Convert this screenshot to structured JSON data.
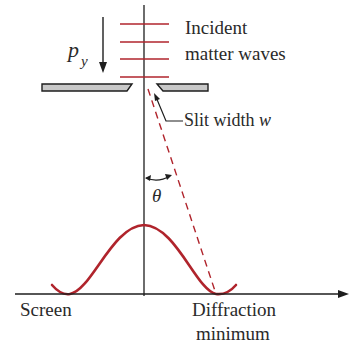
{
  "labels": {
    "momentum": "p",
    "momentum_sub": "y",
    "incident_line1": "Incident",
    "incident_line2": "matter waves",
    "slit_prefix": "Slit width ",
    "slit_var": "w",
    "angle": "θ",
    "screen": "Screen",
    "diffraction_line1": "Diffraction",
    "diffraction_line2": "minimum"
  },
  "colors": {
    "wave_red": "#b0242c",
    "ink": "#1e1e1e",
    "plate_fill": "#c8c8c8"
  },
  "geometry": {
    "axis_x": 144,
    "screen_y": 294,
    "wavefront_ys": [
      24,
      42,
      59,
      77
    ],
    "curve_peak": [
      144,
      225
    ],
    "curve_minima": [
      [
        66,
        294
      ],
      [
        216,
        294
      ]
    ]
  }
}
